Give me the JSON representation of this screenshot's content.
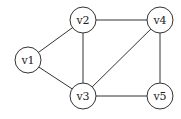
{
  "graph": {
    "nodes": [
      {
        "id": "v1",
        "label": "v1"
      },
      {
        "id": "v2",
        "label": "v2"
      },
      {
        "id": "v3",
        "label": "v3"
      },
      {
        "id": "v4",
        "label": "v4"
      },
      {
        "id": "v5",
        "label": "v5"
      }
    ],
    "edges": [
      [
        "v1",
        "v2"
      ],
      [
        "v1",
        "v3"
      ],
      [
        "v2",
        "v3"
      ],
      [
        "v2",
        "v4"
      ],
      [
        "v3",
        "v4"
      ],
      [
        "v3",
        "v5"
      ],
      [
        "v4",
        "v5"
      ]
    ]
  }
}
